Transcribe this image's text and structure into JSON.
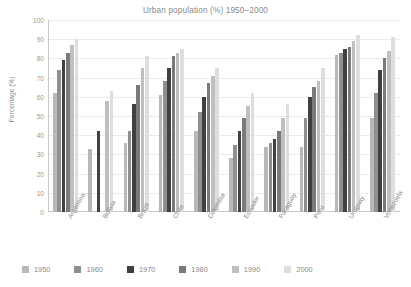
{
  "chart_data": {
    "type": "bar",
    "title": "Urban population (%) 1950–2000",
    "xlabel": "",
    "ylabel": "Percentage (%)",
    "ylim": [
      0,
      100
    ],
    "ytick_step": 10,
    "yticks": [
      100,
      90,
      80,
      70,
      60,
      50,
      40,
      30,
      20,
      10,
      0
    ],
    "grid": true,
    "legend_position": "bottom",
    "categories": [
      "Argentina",
      "Bolivia",
      "Brazil",
      "Chile",
      "Colombia",
      "Ecuador",
      "Paraguay",
      "Peru",
      "Uruguay",
      "Venezuela"
    ],
    "series": [
      {
        "name": "1950",
        "color": "#b8b8b8",
        "values": [
          62,
          33,
          36,
          61,
          42,
          28,
          34,
          34,
          82,
          49
        ]
      },
      {
        "name": "1960",
        "color": "#8f8f8f",
        "values": [
          74,
          null,
          42,
          68,
          52,
          35,
          36,
          49,
          83,
          62
        ]
      },
      {
        "name": "1970",
        "color": "#404040",
        "values": [
          79,
          42,
          56,
          75,
          60,
          42,
          38,
          60,
          85,
          74
        ]
      },
      {
        "name": "1980",
        "color": "#7a7a7a",
        "values": [
          83,
          null,
          66,
          81,
          67,
          49,
          42,
          65,
          86,
          80
        ]
      },
      {
        "name": "1990",
        "color": "#bfbfbf",
        "values": [
          87,
          58,
          75,
          83,
          71,
          55,
          49,
          68,
          89,
          84
        ]
      },
      {
        "name": "2000",
        "color": "#dedede",
        "values": [
          90,
          63,
          81,
          85,
          75,
          62,
          56,
          75,
          92,
          91
        ]
      }
    ]
  },
  "legend": {
    "items": [
      {
        "label": "1950",
        "color": "#b8b8b8"
      },
      {
        "label": "1960",
        "color": "#8f8f8f"
      },
      {
        "label": "1970",
        "color": "#404040"
      },
      {
        "label": "1980",
        "color": "#7a7a7a"
      },
      {
        "label": "1990",
        "color": "#bfbfbf"
      },
      {
        "label": "2000",
        "color": "#dedede"
      }
    ]
  },
  "colors": {
    "axis": "#c9c9c9",
    "grid": "#ececec",
    "text": "#8a8a8a",
    "background": "#ffffff"
  }
}
